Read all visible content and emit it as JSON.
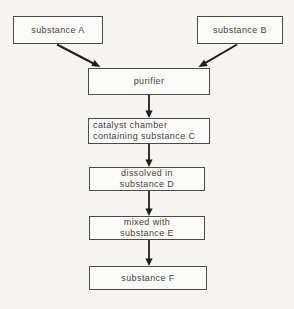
{
  "flowchart": {
    "nodes": {
      "substance_a": {
        "label": "substance A"
      },
      "substance_b": {
        "label": "substance B"
      },
      "purifier": {
        "label": "purifier"
      },
      "catalyst_chamber": {
        "line1": "catalyst chamber",
        "line2": "containing substance C"
      },
      "dissolved_d": {
        "line1": "dissolved in",
        "line2": "substance D"
      },
      "mixed_e": {
        "line1": "mixed with",
        "line2": "substance E"
      },
      "substance_f": {
        "label": "substance F"
      }
    },
    "edges": [
      {
        "from": "substance A",
        "to": "purifier"
      },
      {
        "from": "substance B",
        "to": "purifier"
      },
      {
        "from": "purifier",
        "to": "catalyst chamber containing substance C"
      },
      {
        "from": "catalyst chamber containing substance C",
        "to": "dissolved in substance D"
      },
      {
        "from": "dissolved in substance D",
        "to": "mixed with substance E"
      },
      {
        "from": "mixed with substance E",
        "to": "substance F"
      }
    ],
    "colors": {
      "background": "#f6f5f2",
      "box_fill": "#fbfbf9",
      "border": "#4d4b47",
      "text": "#454341",
      "arrow": "#1f1f1f"
    }
  }
}
